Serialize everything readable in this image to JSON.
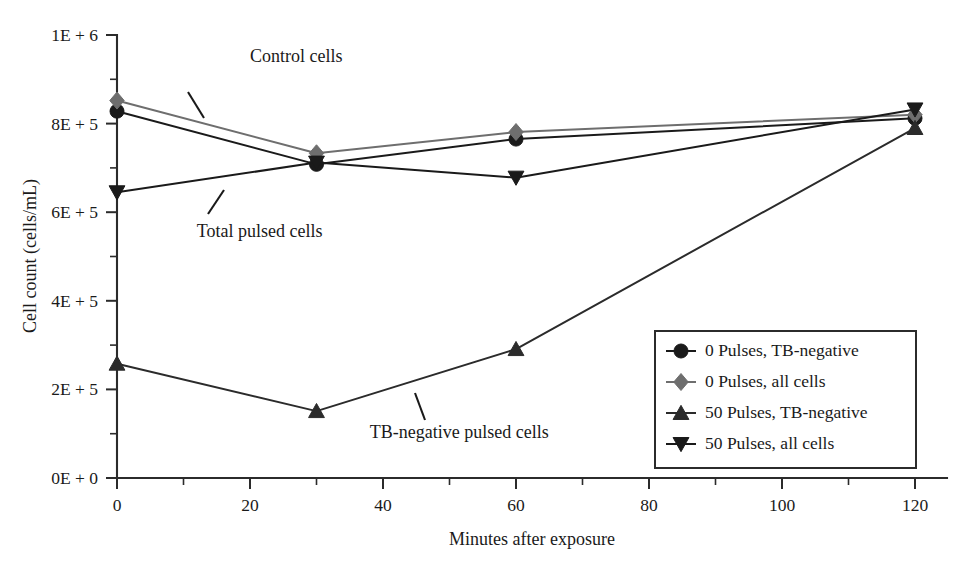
{
  "chart_data": {
    "type": "line",
    "title": "",
    "xlabel": "Minutes after exposure",
    "ylabel": "Cell count (cells/mL)",
    "x": [
      0,
      30,
      60,
      120
    ],
    "xlim": [
      0,
      126
    ],
    "ylim": [
      0,
      1000000
    ],
    "grid": false,
    "legend_position": "bottom-right",
    "x_ticks_major": [
      0,
      20,
      40,
      60,
      80,
      100,
      120
    ],
    "x_tick_labels": [
      "0",
      "20",
      "40",
      "60",
      "80",
      "100",
      "120"
    ],
    "x_ticks_minor": [
      10,
      30,
      50,
      70,
      90,
      110
    ],
    "y_ticks_major": [
      0,
      200000,
      400000,
      600000,
      800000,
      1000000
    ],
    "y_tick_labels": [
      "0E + 0",
      "2E + 5",
      "4E + 5",
      "6E + 5",
      "8E + 5",
      "1E + 6"
    ],
    "y_ticks_minor": [
      100000,
      300000,
      500000,
      700000,
      900000
    ],
    "series": [
      {
        "name": "0 Pulses, TB-negative",
        "marker": "circle",
        "color": "#1a1a1a",
        "values": [
          828000,
          708000,
          765000,
          812000
        ]
      },
      {
        "name": "0 Pulses, all cells",
        "marker": "diamond",
        "color": "#6e6e6e",
        "values": [
          852000,
          733000,
          781000,
          820000
        ]
      },
      {
        "name": "50 Pulses, TB-negative",
        "marker": "triangle-up",
        "color": "#2b2b2b",
        "values": [
          258000,
          151000,
          291000,
          790000
        ]
      },
      {
        "name": "50 Pulses, all cells",
        "marker": "triangle-down",
        "color": "#1a1a1a",
        "values": [
          645000,
          712000,
          678000,
          832000
        ]
      }
    ],
    "annotations": [
      {
        "text": "Control cells",
        "x": 20,
        "y": 940000
      },
      {
        "text": "Total pulsed cells",
        "x": 12,
        "y": 545000
      },
      {
        "text": "TB-negative pulsed cells",
        "x": 38,
        "y": 90000
      }
    ]
  },
  "legend": {
    "entries": [
      {
        "label": "0 Pulses, TB-negative",
        "marker": "circle",
        "color": "#1a1a1a"
      },
      {
        "label": "0 Pulses, all cells",
        "marker": "diamond",
        "color": "#6e6e6e"
      },
      {
        "label": "50 Pulses, TB-negative",
        "marker": "triangle-up",
        "color": "#2b2b2b"
      },
      {
        "label": "50 Pulses, all cells",
        "marker": "triangle-down",
        "color": "#1a1a1a"
      }
    ]
  }
}
